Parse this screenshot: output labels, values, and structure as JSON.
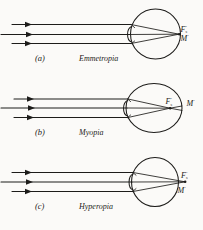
{
  "figure": {
    "background_color": "#fbfaf8",
    "ink_color": "#1d1c1a",
    "width": 203,
    "height": 230
  },
  "panels": [
    {
      "index_label": "(a)",
      "name_label": "Emmetropia",
      "focal_point_label": "F",
      "focal_point_prime": "'",
      "focal_point_subscript": "s",
      "macula_label": "M",
      "macula_prime": "'",
      "eye_shape": "round",
      "focus_location": "on the retina",
      "ray_count": 3
    },
    {
      "index_label": "(b)",
      "name_label": "Myopia",
      "focal_point_label": "F",
      "focal_point_prime": "'",
      "focal_point_subscript": "s",
      "macula_label": "M",
      "macula_prime": "'",
      "eye_shape": "elongated",
      "focus_location": "in front of the retina",
      "ray_count": 3
    },
    {
      "index_label": "(c)",
      "name_label": "Hyperopia",
      "focal_point_label": "F",
      "focal_point_prime": "'",
      "focal_point_subscript": "s",
      "macula_label": "M",
      "macula_prime": "'",
      "eye_shape": "shortened",
      "focus_location": "behind the retina",
      "ray_count": 3
    }
  ]
}
